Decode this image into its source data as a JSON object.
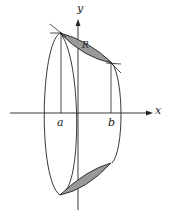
{
  "figure": {
    "labels": {
      "y_axis": "y",
      "x_axis": "x",
      "a": "a",
      "b": "b",
      "R": "R"
    },
    "colors": {
      "stroke": "#222222",
      "fill": "#999999"
    }
  }
}
